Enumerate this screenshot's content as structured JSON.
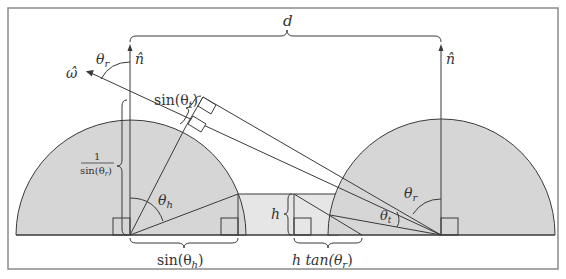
{
  "diagram": {
    "title": "",
    "labels": {
      "distance": "d",
      "normal_left": "n̂",
      "normal_right": "n̂",
      "omega": "ω̂",
      "theta_r_top": "θ",
      "theta_r_top_sub": "r",
      "sin_theta_t": "sin(θ",
      "sin_theta_t_sub": "t",
      "sin_theta_t_close": ")",
      "one_over_num": "1",
      "one_over_den": "sin(θ",
      "one_over_den_sub": "r",
      "one_over_den_close": ")",
      "theta_h": "θ",
      "theta_h_sub": "h",
      "h": "h",
      "sin_theta_h": "sin(θ",
      "sin_theta_h_sub": "h",
      "sin_theta_h_close": ")",
      "h_tan_prefix": "h tan(θ",
      "h_tan_sub": "r",
      "h_tan_close": ")",
      "theta_r_right": "θ",
      "theta_r_right_sub": "r",
      "theta_t": "θ",
      "theta_t_sub": "t"
    },
    "colors": {
      "stroke": "#3a3a3a",
      "hemisphere_fill": "#d6d6d6",
      "slab_fill": "#e6e6e6",
      "frame": "#8a8a8a",
      "background": "#ffffff"
    }
  }
}
